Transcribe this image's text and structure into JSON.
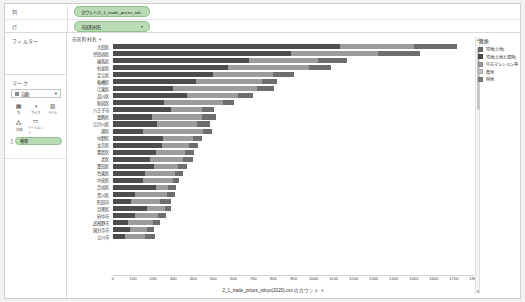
{
  "shelves": {
    "columns_label": "列",
    "rows_label": "行",
    "columns_pill": "カウント(2_1_trade_prices_tok..",
    "rows_pill": "市区町村名",
    "pill_caret": "▾"
  },
  "sidebar": {
    "filters_title": "フィルター",
    "marks_title": "マーク",
    "mark_type": "自動",
    "mark_type_caret": "▾",
    "buttons": [
      {
        "icon": "color-icon",
        "glyph": "▦",
        "label": "色"
      },
      {
        "icon": "size-icon",
        "glyph": "◑",
        "label": "サイズ"
      },
      {
        "icon": "label-icon",
        "glyph": "▥",
        "label": "ラベル"
      },
      {
        "icon": "detail-icon",
        "glyph": "⁂",
        "label": "詳細"
      },
      {
        "icon": "tooltip-icon",
        "glyph": "▭",
        "label": "ツールヒント"
      }
    ],
    "mark_pill": "種類",
    "mark_pill_dots": "⣿"
  },
  "legend": {
    "title": "種類",
    "items": [
      {
        "label": "宅地(土地)",
        "color": "#6e6e6e"
      },
      {
        "label": "宅地(土地と建物)",
        "color": "#4d4d4d"
      },
      {
        "label": "中古マンション等",
        "color": "#9c9c9c"
      },
      {
        "label": "農地",
        "color": "#c3c3c3"
      },
      {
        "label": "林地",
        "color": "#7f7f7f"
      }
    ]
  },
  "axis": {
    "y_header": "市区町村名",
    "y_header_caret": "▾",
    "x_title": "2_1_trade_prices_tokyo(2020).csv のカウント",
    "x_title_caret": "▾",
    "scroll_up": "▲",
    "scroll_down": "▼"
  },
  "chart_data": {
    "type": "bar",
    "orientation": "horizontal",
    "stacked": true,
    "title": "",
    "xlabel": "2_1_trade_prices_tokyo(2020).csv のカウント",
    "ylabel": "市区町村名",
    "xlim": [
      0,
      1800
    ],
    "xticks": [
      0,
      100,
      200,
      300,
      400,
      500,
      600,
      700,
      800,
      900,
      1000,
      1100,
      1200,
      1300,
      1400,
      1500,
      1600,
      1700,
      1800
    ],
    "grid": false,
    "legend_position": "right",
    "categories": [
      "大田区",
      "世田谷区",
      "練馬区",
      "杉並区",
      "足立区",
      "板橋区",
      "江東区",
      "品川区",
      "新宿区",
      "八王子市",
      "葛飾区",
      "江戸川区",
      "港区",
      "中野区",
      "文京区",
      "豊島区",
      "北区",
      "墨田区",
      "台東区",
      "中央区",
      "渋谷区",
      "荒川区",
      "町田市",
      "目黒区",
      "府中市",
      "武蔵野市",
      "国分寺市",
      "立川市"
    ],
    "series": [
      {
        "name": "宅地(土地と建物)",
        "color": "#4d4d4d",
        "values": [
          1130,
          890,
          680,
          575,
          500,
          415,
          300,
          370,
          255,
          290,
          195,
          220,
          150,
          250,
          245,
          215,
          185,
          205,
          160,
          150,
          215,
          110,
          90,
          170,
          110,
          75,
          85,
          60
        ]
      },
      {
        "name": "中古マンション等",
        "color": "#9c9c9c",
        "values": [
          370,
          430,
          340,
          400,
          300,
          330,
          420,
          255,
          295,
          155,
          250,
          200,
          300,
          150,
          135,
          145,
          165,
          120,
          150,
          150,
          60,
          160,
          145,
          90,
          115,
          125,
          85,
          100
        ]
      },
      {
        "name": "宅地(土地)",
        "color": "#6e6e6e",
        "values": [
          215,
          210,
          145,
          110,
          105,
          75,
          85,
          75,
          55,
          60,
          70,
          65,
          45,
          45,
          45,
          45,
          50,
          45,
          40,
          30,
          40,
          40,
          55,
          30,
          40,
          35,
          35,
          50
        ]
      }
    ],
    "totals": [
      1715,
      1530,
      1165,
      1085,
      905,
      820,
      805,
      700,
      605,
      505,
      515,
      485,
      495,
      445,
      425,
      405,
      400,
      370,
      350,
      330,
      315,
      310,
      290,
      290,
      265,
      235,
      205,
      210
    ]
  }
}
